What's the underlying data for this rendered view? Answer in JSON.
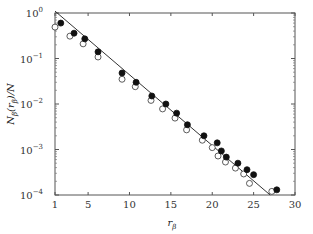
{
  "chart_data": {
    "type": "scatter",
    "title": "",
    "xlabel": "r_β",
    "ylabel": "N_β(r_β)/N",
    "xscale": "linear",
    "yscale": "log",
    "xlim": [
      1,
      30
    ],
    "ylim": [
      0.0001,
      1
    ],
    "grid": false,
    "legend": null,
    "x_ticks": [
      1,
      5,
      10,
      15,
      20,
      25,
      30
    ],
    "x_tick_labels": [
      "1",
      "5",
      "10",
      "15",
      "20",
      "25",
      "30"
    ],
    "y_ticks": [
      1,
      0.1,
      0.01,
      0.001,
      0.0001
    ],
    "y_tick_labels": [
      {
        "base": "10",
        "exp": "0"
      },
      {
        "base": "10",
        "exp": "−1"
      },
      {
        "base": "10",
        "exp": "−2"
      },
      {
        "base": "10",
        "exp": "−3"
      },
      {
        "base": "10",
        "exp": "−4"
      }
    ],
    "series": [
      {
        "name": "filled",
        "marker": "filled-circle",
        "color": "#111111",
        "x": [
          1.7,
          3.3,
          4.6,
          6.2,
          9.1,
          10.8,
          12.7,
          14.4,
          15.7,
          17.0,
          19.0,
          20.6,
          21.1,
          21.7,
          23.1,
          24.2,
          25.0,
          27.8
        ],
        "y": [
          0.6,
          0.36,
          0.27,
          0.14,
          0.048,
          0.03,
          0.015,
          0.01,
          0.0063,
          0.0035,
          0.002,
          0.0014,
          0.00093,
          0.00068,
          0.0005,
          0.00036,
          0.00028,
          0.00013
        ]
      },
      {
        "name": "open",
        "marker": "open-circle",
        "color": "#333333",
        "x": [
          1.0,
          2.8,
          4.4,
          6.2,
          9.1,
          10.7,
          12.6,
          14.0,
          15.5,
          16.9,
          18.8,
          20.0,
          20.7,
          21.6,
          22.8,
          23.8,
          24.5,
          27.2
        ],
        "y": [
          0.49,
          0.31,
          0.21,
          0.108,
          0.035,
          0.024,
          0.012,
          0.0078,
          0.0049,
          0.0027,
          0.0016,
          0.0011,
          0.00072,
          0.00053,
          0.00039,
          0.00029,
          0.00018,
          0.00012
        ]
      },
      {
        "name": "fit",
        "type": "line",
        "color": "#333333",
        "x": [
          1.0,
          27.0
        ],
        "y": [
          1.1,
          0.0001
        ]
      }
    ]
  }
}
